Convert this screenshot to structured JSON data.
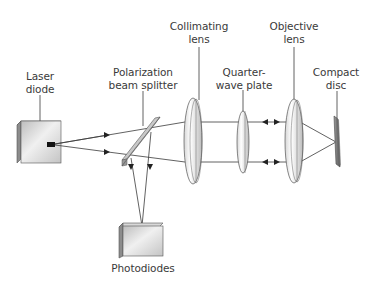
{
  "diagram": {
    "title": "",
    "type": "optical-schematic",
    "components": [
      {
        "id": "laser-diode",
        "label_lines": [
          "Laser",
          "diode"
        ]
      },
      {
        "id": "beam-splitter",
        "label_lines": [
          "Polarization",
          "beam splitter"
        ]
      },
      {
        "id": "collimating-lens",
        "label_lines": [
          "Collimating",
          "lens"
        ]
      },
      {
        "id": "quarter-wave-plate",
        "label_lines": [
          "Quarter-",
          "wave plate"
        ]
      },
      {
        "id": "objective-lens",
        "label_lines": [
          "Objective",
          "lens"
        ]
      },
      {
        "id": "compact-disc",
        "label_lines": [
          "Compact",
          "disc"
        ]
      },
      {
        "id": "photodiodes",
        "label_lines": [
          "Photodiodes"
        ]
      }
    ],
    "connections": [
      {
        "from": "laser-diode",
        "to": "beam-splitter",
        "kind": "diverging beam"
      },
      {
        "from": "beam-splitter",
        "to": "collimating-lens",
        "kind": "diverging beam"
      },
      {
        "from": "collimating-lens",
        "to": "quarter-wave-plate",
        "kind": "parallel beam"
      },
      {
        "from": "quarter-wave-plate",
        "to": "objective-lens",
        "kind": "parallel beam, bidirectional"
      },
      {
        "from": "objective-lens",
        "to": "compact-disc",
        "kind": "converging beam"
      },
      {
        "from": "beam-splitter",
        "to": "photodiodes",
        "kind": "reflected return beam"
      }
    ],
    "colors": {
      "line": "#3a3a3a",
      "text": "#3a3a3a",
      "component_fill_light": "#f2f2f2",
      "component_fill_dark": "#9a9a9a"
    }
  }
}
